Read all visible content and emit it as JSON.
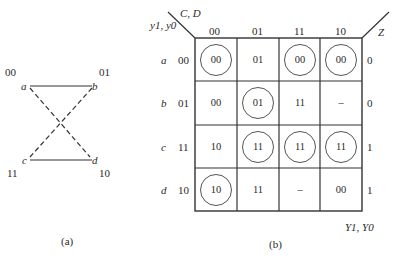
{
  "diagram_a": {
    "caption": "(a)",
    "nodes": [
      {
        "name": "a",
        "code": "00"
      },
      {
        "name": "b",
        "code": "01"
      },
      {
        "name": "c",
        "code": "11"
      },
      {
        "name": "d",
        "code": "10"
      }
    ],
    "edges": [
      {
        "from": "a",
        "to": "b",
        "style": "solid"
      },
      {
        "from": "c",
        "to": "d",
        "style": "solid"
      },
      {
        "from": "a",
        "to": "d",
        "style": "dashed"
      },
      {
        "from": "b",
        "to": "c",
        "style": "dashed"
      }
    ]
  },
  "diagram_b": {
    "caption": "(b)",
    "col_var_label": "C, D",
    "row_var_label": "y1, y0",
    "output_label": "Z",
    "next_state_label": "Y1, Y0",
    "columns": [
      "00",
      "01",
      "11",
      "10"
    ],
    "rows": [
      {
        "state": "a",
        "code": "00",
        "z": "0",
        "cells": [
          {
            "v": "00",
            "c": true
          },
          {
            "v": "01",
            "c": false
          },
          {
            "v": "00",
            "c": true
          },
          {
            "v": "00",
            "c": true
          }
        ]
      },
      {
        "state": "b",
        "code": "01",
        "z": "0",
        "cells": [
          {
            "v": "00",
            "c": false
          },
          {
            "v": "01",
            "c": true
          },
          {
            "v": "11",
            "c": false
          },
          {
            "v": "–",
            "c": false
          }
        ]
      },
      {
        "state": "c",
        "code": "11",
        "z": "1",
        "cells": [
          {
            "v": "10",
            "c": false
          },
          {
            "v": "11",
            "c": true
          },
          {
            "v": "11",
            "c": true
          },
          {
            "v": "11",
            "c": true
          }
        ]
      },
      {
        "state": "d",
        "code": "10",
        "z": "1",
        "cells": [
          {
            "v": "10",
            "c": true
          },
          {
            "v": "11",
            "c": false
          },
          {
            "v": "–",
            "c": false
          },
          {
            "v": "00",
            "c": false
          }
        ]
      }
    ]
  }
}
